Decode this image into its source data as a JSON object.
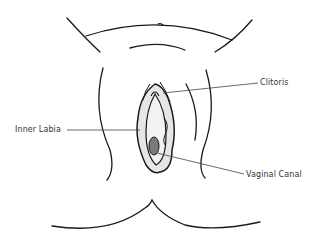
{
  "diagram": {
    "type": "anatomical-illustration",
    "labels": [
      {
        "id": "clitoris",
        "text": "Clitoris"
      },
      {
        "id": "inner-labia",
        "text": "Inner Labia"
      },
      {
        "id": "vaginal-canal",
        "text": "Vaginal Canal"
      }
    ],
    "colors": {
      "stroke": "#1a1a1a",
      "fill_light": "#e6e6e6",
      "fill_dark": "#7a7a7a",
      "leader_line": "#444444",
      "text": "#333333"
    }
  }
}
